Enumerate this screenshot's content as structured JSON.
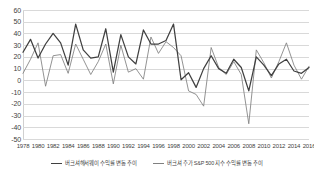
{
  "chart_data": {
    "type": "line",
    "title": "",
    "xlabel": "",
    "ylabel": "",
    "ylim": [
      -50,
      60
    ],
    "ytick_step": 10,
    "yticks": [
      60,
      50,
      40,
      30,
      20,
      10,
      0,
      -10,
      -20,
      -30,
      -40,
      -50
    ],
    "grid": true,
    "legend_position": "bottom",
    "x": [
      1978,
      1979,
      1980,
      1981,
      1982,
      1983,
      1984,
      1985,
      1986,
      1987,
      1988,
      1989,
      1990,
      1991,
      1992,
      1993,
      1994,
      1995,
      1996,
      1997,
      1998,
      1999,
      2000,
      2001,
      2002,
      2003,
      2004,
      2005,
      2006,
      2007,
      2008,
      2009,
      2010,
      2011,
      2012,
      2013,
      2014,
      2015,
      2016
    ],
    "xticks": [
      "1978",
      "1980",
      "1982",
      "1984",
      "1986",
      "1988",
      "1990",
      "1992",
      "1994",
      "1996",
      "1998",
      "2000",
      "2002",
      "2004",
      "2006",
      "2008",
      "2010",
      "2012",
      "2014",
      "2016"
    ],
    "series": [
      {
        "name": "버크셔해서웨이 수익률 변동 추이",
        "color": "#404040",
        "values": [
          24,
          35,
          19,
          31,
          40,
          32,
          13,
          48,
          26,
          19,
          20,
          44,
          7,
          39,
          20,
          14,
          43,
          31,
          31,
          34,
          48,
          0.5,
          6.5,
          -6,
          10,
          21,
          10,
          6,
          18,
          11,
          -9,
          20,
          13,
          4,
          14,
          18,
          8,
          6,
          11
        ]
      },
      {
        "name": "버크셔 주가 S&P 500 지수 수익률 변동 추이",
        "color": "#808080",
        "values": [
          6,
          18,
          32,
          -5,
          21,
          22,
          6,
          31,
          18,
          5,
          16,
          31,
          -3,
          30,
          7,
          10,
          1,
          37,
          23,
          33,
          28,
          21,
          -9,
          -12,
          -22,
          28,
          11,
          5,
          16,
          5,
          -37,
          26,
          15,
          2,
          16,
          32,
          13,
          1,
          12
        ]
      }
    ]
  },
  "yaxis": {
    "ticks": [
      {
        "label": "60",
        "value": 60
      },
      {
        "label": "50",
        "value": 50
      },
      {
        "label": "40",
        "value": 40
      },
      {
        "label": "30",
        "value": 30
      },
      {
        "label": "20",
        "value": 20
      },
      {
        "label": "10",
        "value": 10
      },
      {
        "label": "0",
        "value": 0
      },
      {
        "label": "-10",
        "value": -10
      },
      {
        "label": "-20",
        "value": -20
      },
      {
        "label": "-30",
        "value": -30
      },
      {
        "label": "-40",
        "value": -40
      },
      {
        "label": "-50",
        "value": -50
      }
    ]
  },
  "xaxis": {
    "ticks": [
      "1978",
      "1980",
      "1982",
      "1984",
      "1986",
      "1988",
      "1990",
      "1992",
      "1994",
      "1996",
      "1998",
      "2000",
      "2002",
      "2004",
      "2006",
      "2008",
      "2010",
      "2012",
      "2014",
      "2016"
    ]
  },
  "legend": {
    "items": [
      {
        "label": "버크셔해서웨이 수익률 변동 추이",
        "color": "#404040"
      },
      {
        "label": "버크셔 주가 S&P 500 지수 수익률 변동 추이",
        "color": "#808080"
      }
    ]
  }
}
